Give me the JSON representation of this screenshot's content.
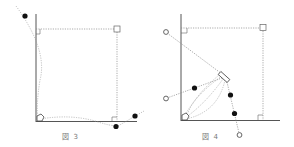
{
  "figures": [
    {
      "id": "fig3",
      "caption_prefix": "図",
      "caption_number": "3"
    },
    {
      "id": "fig4",
      "caption_prefix": "図",
      "caption_number": "4"
    }
  ],
  "colors": {
    "axis": "#555555",
    "dotted": "#888888",
    "marker": "#111111",
    "background": "#ffffff"
  }
}
